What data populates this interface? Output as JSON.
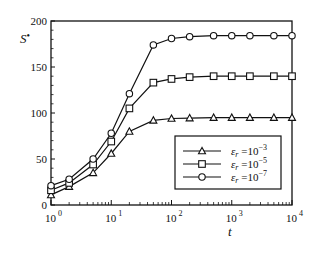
{
  "chart_data": {
    "type": "line",
    "title": "",
    "xlabel": "t",
    "ylabel": "S*",
    "xscale": "log",
    "xlim": [
      1,
      10000
    ],
    "ylim": [
      0,
      200
    ],
    "x_ticks": [
      {
        "base": "10",
        "exp": "0",
        "value": 1
      },
      {
        "base": "10",
        "exp": "1",
        "value": 10
      },
      {
        "base": "10",
        "exp": "2",
        "value": 100
      },
      {
        "base": "10",
        "exp": "3",
        "value": 1000
      },
      {
        "base": "10",
        "exp": "4",
        "value": 10000
      }
    ],
    "y_ticks": [
      0,
      50,
      100,
      150,
      200
    ],
    "grid": false,
    "legend_position": "lower right (inside)",
    "x": [
      1,
      2,
      5,
      10,
      20,
      50,
      100,
      200,
      500,
      1000,
      2000,
      5000,
      10000
    ],
    "series": [
      {
        "name": "ε_r = 10^-3",
        "symbol": "varepsilon",
        "sub": "r",
        "eq": " =10",
        "exp": "−3",
        "marker": "triangle",
        "values": [
          11,
          20,
          35,
          56,
          80,
          92,
          94,
          94.5,
          95,
          95,
          95,
          95,
          95
        ]
      },
      {
        "name": "ε_r = 10^-5",
        "symbol": "varepsilon",
        "sub": "r",
        "eq": " =10",
        "exp": "−5",
        "marker": "square",
        "values": [
          16,
          24,
          44,
          69,
          105,
          133,
          137,
          139,
          140,
          140,
          140,
          140,
          140
        ]
      },
      {
        "name": "ε_r = 10^-7",
        "symbol": "varepsilon",
        "sub": "r",
        "eq": " =10",
        "exp": "−7",
        "marker": "circle",
        "values": [
          21,
          28,
          50,
          78,
          121,
          174,
          181,
          183,
          184,
          184,
          184,
          184,
          184
        ]
      }
    ]
  },
  "labels": {
    "ylabel_main": "S",
    "ylabel_mark": "•",
    "xlabel": "t"
  },
  "colors": {
    "line": "#111111",
    "background": "#ffffff"
  }
}
